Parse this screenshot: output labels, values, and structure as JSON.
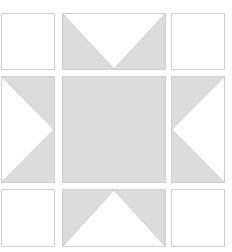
{
  "diagram": {
    "type": "quilt-block",
    "pattern": "sawtooth-star",
    "grid": {
      "columns": [
        {
          "x": 1,
          "width": 54
        },
        {
          "x": 62,
          "width": 103
        },
        {
          "x": 171,
          "width": 53
        }
      ],
      "rows": [
        {
          "y": 13,
          "height": 56
        },
        {
          "y": 76,
          "height": 106
        },
        {
          "y": 189,
          "height": 57
        }
      ]
    },
    "colors": {
      "fill": "#dcdcdc",
      "background": "#ffffff",
      "border": "#cfcfcf"
    },
    "cells": [
      {
        "id": "top-left",
        "kind": "plain-square"
      },
      {
        "id": "top-middle",
        "kind": "flying-geese",
        "white_triangle_points": "down"
      },
      {
        "id": "top-right",
        "kind": "plain-square"
      },
      {
        "id": "middle-left",
        "kind": "flying-geese",
        "white_triangle_points": "right"
      },
      {
        "id": "center",
        "kind": "filled-square"
      },
      {
        "id": "middle-right",
        "kind": "flying-geese",
        "white_triangle_points": "left"
      },
      {
        "id": "bottom-left",
        "kind": "plain-square"
      },
      {
        "id": "bottom-middle",
        "kind": "flying-geese",
        "white_triangle_points": "up"
      },
      {
        "id": "bottom-right",
        "kind": "plain-square"
      }
    ]
  }
}
